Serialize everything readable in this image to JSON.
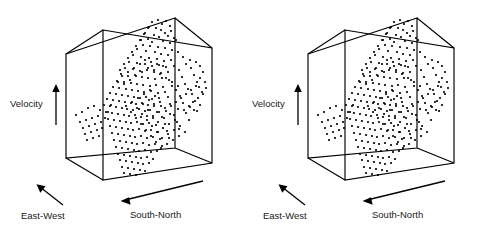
{
  "figure": {
    "type": "stereo-pair-3d-scatter",
    "background": "#ffffff",
    "ink": "#000000",
    "panel_count": 2
  },
  "panels": [
    {
      "id": "left",
      "name": "3d-scatter-left",
      "axes": {
        "velocity": {
          "label": "Velocity",
          "arrow": "up"
        },
        "east_west": {
          "label": "East-West",
          "arrow": "up-left"
        },
        "south_north": {
          "label": "South-North",
          "arrow": "left"
        }
      }
    },
    {
      "id": "right",
      "name": "3d-scatter-right",
      "axes": {
        "velocity": {
          "label": "Velocity",
          "arrow": "up"
        },
        "east_west": {
          "label": "East-West",
          "arrow": "up-left"
        },
        "south_north": {
          "label": "South-North",
          "arrow": "left"
        }
      }
    }
  ],
  "chart_data": {
    "type": "scatter",
    "title": "",
    "xlabel": "South-North",
    "ylabel": "Velocity",
    "zlabel": "East-West",
    "grid": false,
    "legend": null,
    "axis_ticks": [],
    "projection": "oblique-3d-wireframe-box",
    "box": {
      "front_top_left": [
        103,
        30
      ],
      "front_top_right": [
        212,
        48
      ],
      "front_bottom_left": [
        103,
        180
      ],
      "front_bottom_right": [
        212,
        163
      ],
      "back_top_left": [
        66,
        54
      ],
      "back_top_right": [
        175,
        18
      ],
      "back_bottom_left": [
        66,
        158
      ],
      "back_bottom_right": [
        175,
        148
      ]
    },
    "points": [
      [
        152,
        22
      ],
      [
        158,
        20
      ],
      [
        162,
        24
      ],
      [
        166,
        21
      ],
      [
        170,
        26
      ],
      [
        156,
        28
      ],
      [
        161,
        30
      ],
      [
        149,
        27
      ],
      [
        165,
        33
      ],
      [
        171,
        31
      ],
      [
        145,
        33
      ],
      [
        154,
        35
      ],
      [
        159,
        37
      ],
      [
        168,
        36
      ],
      [
        174,
        38
      ],
      [
        148,
        39
      ],
      [
        141,
        40
      ],
      [
        152,
        42
      ],
      [
        163,
        41
      ],
      [
        170,
        43
      ],
      [
        176,
        40
      ],
      [
        143,
        45
      ],
      [
        150,
        46
      ],
      [
        158,
        47
      ],
      [
        165,
        48
      ],
      [
        172,
        50
      ],
      [
        137,
        49
      ],
      [
        146,
        51
      ],
      [
        155,
        52
      ],
      [
        161,
        54
      ],
      [
        168,
        55
      ],
      [
        178,
        52
      ],
      [
        133,
        55
      ],
      [
        141,
        57
      ],
      [
        149,
        58
      ],
      [
        157,
        59
      ],
      [
        164,
        61
      ],
      [
        171,
        60
      ],
      [
        183,
        57
      ],
      [
        190,
        60
      ],
      [
        129,
        62
      ],
      [
        137,
        63
      ],
      [
        145,
        64
      ],
      [
        152,
        66
      ],
      [
        159,
        65
      ],
      [
        166,
        67
      ],
      [
        174,
        66
      ],
      [
        186,
        64
      ],
      [
        196,
        62
      ],
      [
        125,
        68
      ],
      [
        133,
        69
      ],
      [
        140,
        71
      ],
      [
        147,
        70
      ],
      [
        154,
        72
      ],
      [
        161,
        73
      ],
      [
        168,
        72
      ],
      [
        179,
        70
      ],
      [
        191,
        68
      ],
      [
        200,
        66
      ],
      [
        121,
        74
      ],
      [
        128,
        76
      ],
      [
        135,
        75
      ],
      [
        142,
        77
      ],
      [
        148,
        78
      ],
      [
        155,
        79
      ],
      [
        162,
        78
      ],
      [
        169,
        80
      ],
      [
        182,
        77
      ],
      [
        194,
        75
      ],
      [
        203,
        72
      ],
      [
        117,
        81
      ],
      [
        124,
        82
      ],
      [
        131,
        83
      ],
      [
        137,
        84
      ],
      [
        143,
        85
      ],
      [
        150,
        86
      ],
      [
        156,
        85
      ],
      [
        163,
        87
      ],
      [
        172,
        86
      ],
      [
        185,
        84
      ],
      [
        197,
        82
      ],
      [
        113,
        87
      ],
      [
        119,
        88
      ],
      [
        126,
        89
      ],
      [
        132,
        90
      ],
      [
        138,
        91
      ],
      [
        144,
        92
      ],
      [
        151,
        91
      ],
      [
        158,
        93
      ],
      [
        165,
        92
      ],
      [
        176,
        90
      ],
      [
        188,
        89
      ],
      [
        199,
        87
      ],
      [
        110,
        93
      ],
      [
        116,
        94
      ],
      [
        122,
        95
      ],
      [
        128,
        96
      ],
      [
        134,
        97
      ],
      [
        140,
        98
      ],
      [
        146,
        97
      ],
      [
        152,
        99
      ],
      [
        159,
        98
      ],
      [
        168,
        97
      ],
      [
        180,
        96
      ],
      [
        192,
        94
      ],
      [
        202,
        92
      ],
      [
        107,
        99
      ],
      [
        113,
        100
      ],
      [
        119,
        101
      ],
      [
        125,
        102
      ],
      [
        131,
        103
      ],
      [
        136,
        104
      ],
      [
        142,
        103
      ],
      [
        148,
        105
      ],
      [
        154,
        104
      ],
      [
        161,
        106
      ],
      [
        170,
        104
      ],
      [
        183,
        103
      ],
      [
        195,
        101
      ],
      [
        104,
        105
      ],
      [
        110,
        106
      ],
      [
        116,
        107
      ],
      [
        122,
        108
      ],
      [
        127,
        109
      ],
      [
        133,
        110
      ],
      [
        139,
        109
      ],
      [
        145,
        111
      ],
      [
        150,
        110
      ],
      [
        157,
        112
      ],
      [
        166,
        111
      ],
      [
        178,
        109
      ],
      [
        190,
        107
      ],
      [
        200,
        105
      ],
      [
        106,
        112
      ],
      [
        112,
        113
      ],
      [
        118,
        114
      ],
      [
        124,
        115
      ],
      [
        129,
        116
      ],
      [
        135,
        115
      ],
      [
        141,
        117
      ],
      [
        147,
        116
      ],
      [
        153,
        118
      ],
      [
        162,
        117
      ],
      [
        174,
        115
      ],
      [
        186,
        113
      ],
      [
        197,
        111
      ],
      [
        108,
        119
      ],
      [
        114,
        120
      ],
      [
        120,
        121
      ],
      [
        126,
        122
      ],
      [
        131,
        123
      ],
      [
        137,
        122
      ],
      [
        143,
        124
      ],
      [
        149,
        123
      ],
      [
        156,
        125
      ],
      [
        165,
        124
      ],
      [
        177,
        122
      ],
      [
        189,
        120
      ],
      [
        110,
        126
      ],
      [
        116,
        127
      ],
      [
        122,
        128
      ],
      [
        128,
        129
      ],
      [
        133,
        130
      ],
      [
        139,
        129
      ],
      [
        145,
        131
      ],
      [
        151,
        130
      ],
      [
        158,
        132
      ],
      [
        167,
        131
      ],
      [
        179,
        129
      ],
      [
        112,
        133
      ],
      [
        118,
        134
      ],
      [
        124,
        135
      ],
      [
        130,
        136
      ],
      [
        135,
        137
      ],
      [
        141,
        136
      ],
      [
        147,
        138
      ],
      [
        153,
        137
      ],
      [
        160,
        139
      ],
      [
        169,
        138
      ],
      [
        114,
        140
      ],
      [
        120,
        141
      ],
      [
        126,
        142
      ],
      [
        132,
        143
      ],
      [
        137,
        144
      ],
      [
        143,
        143
      ],
      [
        149,
        145
      ],
      [
        155,
        144
      ],
      [
        162,
        146
      ],
      [
        116,
        147
      ],
      [
        122,
        148
      ],
      [
        128,
        149
      ],
      [
        134,
        150
      ],
      [
        139,
        151
      ],
      [
        145,
        150
      ],
      [
        151,
        152
      ],
      [
        157,
        151
      ],
      [
        118,
        154
      ],
      [
        124,
        155
      ],
      [
        130,
        156
      ],
      [
        136,
        157
      ],
      [
        141,
        158
      ],
      [
        147,
        157
      ],
      [
        153,
        159
      ],
      [
        120,
        160
      ],
      [
        126,
        161
      ],
      [
        132,
        162
      ],
      [
        138,
        163
      ],
      [
        143,
        164
      ],
      [
        149,
        163
      ],
      [
        122,
        167
      ],
      [
        128,
        168
      ],
      [
        134,
        169
      ],
      [
        140,
        170
      ],
      [
        145,
        171
      ],
      [
        124,
        173
      ],
      [
        130,
        174
      ],
      [
        136,
        175
      ],
      [
        88,
        108
      ],
      [
        94,
        106
      ],
      [
        100,
        110
      ],
      [
        82,
        112
      ],
      [
        76,
        115
      ],
      [
        92,
        118
      ],
      [
        98,
        116
      ],
      [
        86,
        120
      ],
      [
        80,
        122
      ],
      [
        95,
        124
      ],
      [
        101,
        122
      ],
      [
        89,
        126
      ],
      [
        83,
        128
      ],
      [
        97,
        130
      ],
      [
        91,
        132
      ],
      [
        85,
        134
      ],
      [
        99,
        136
      ],
      [
        93,
        138
      ],
      [
        87,
        140
      ],
      [
        102,
        128
      ],
      [
        105,
        118
      ],
      [
        108,
        112
      ],
      [
        111,
        105
      ],
      [
        200,
        78
      ],
      [
        205,
        82
      ],
      [
        196,
        86
      ],
      [
        191,
        90
      ],
      [
        203,
        94
      ],
      [
        198,
        98
      ],
      [
        193,
        102
      ],
      [
        206,
        88
      ],
      [
        186,
        94
      ],
      [
        181,
        98
      ],
      [
        176,
        102
      ],
      [
        171,
        106
      ],
      [
        184,
        110
      ],
      [
        189,
        106
      ],
      [
        194,
        110
      ],
      [
        145,
        60
      ],
      [
        151,
        62
      ],
      [
        157,
        64
      ],
      [
        163,
        66
      ],
      [
        140,
        64
      ],
      [
        134,
        68
      ],
      [
        128,
        72
      ],
      [
        122,
        76
      ],
      [
        118,
        82
      ],
      [
        124,
        84
      ],
      [
        130,
        80
      ],
      [
        136,
        76
      ],
      [
        142,
        72
      ],
      [
        148,
        68
      ],
      [
        154,
        70
      ],
      [
        160,
        74
      ],
      [
        166,
        78
      ],
      [
        172,
        82
      ],
      [
        178,
        86
      ],
      [
        150,
        90
      ],
      [
        144,
        94
      ],
      [
        138,
        98
      ],
      [
        132,
        102
      ],
      [
        126,
        106
      ],
      [
        155,
        96
      ],
      [
        149,
        100
      ],
      [
        143,
        104
      ],
      [
        137,
        108
      ],
      [
        131,
        112
      ],
      [
        160,
        102
      ],
      [
        154,
        106
      ],
      [
        148,
        110
      ],
      [
        142,
        114
      ],
      [
        136,
        118
      ],
      [
        165,
        108
      ],
      [
        159,
        112
      ],
      [
        153,
        116
      ],
      [
        147,
        120
      ],
      [
        141,
        124
      ],
      [
        170,
        114
      ],
      [
        164,
        118
      ],
      [
        158,
        122
      ],
      [
        152,
        126
      ],
      [
        146,
        130
      ],
      [
        175,
        120
      ],
      [
        169,
        124
      ],
      [
        163,
        128
      ],
      [
        157,
        132
      ],
      [
        151,
        136
      ],
      [
        180,
        126
      ],
      [
        174,
        130
      ],
      [
        168,
        134
      ],
      [
        162,
        138
      ],
      [
        156,
        142
      ],
      [
        185,
        132
      ],
      [
        179,
        136
      ],
      [
        173,
        140
      ],
      [
        167,
        144
      ],
      [
        161,
        148
      ],
      [
        128,
        58
      ],
      [
        132,
        52
      ],
      [
        136,
        46
      ],
      [
        140,
        40
      ],
      [
        144,
        34
      ],
      [
        148,
        28
      ],
      [
        124,
        64
      ],
      [
        120,
        70
      ]
    ],
    "point_count": 310,
    "point_radius": 1.1,
    "clusters": [
      {
        "name": "dense-core",
        "center": [
          136,
          108
        ],
        "extent": [
          40,
          45
        ],
        "density": "high"
      },
      {
        "name": "upper-filament",
        "center": [
          160,
          40
        ],
        "extent": [
          45,
          40
        ],
        "density": "medium"
      },
      {
        "name": "lower-filament",
        "center": [
          130,
          160
        ],
        "extent": [
          45,
          35
        ],
        "density": "medium"
      },
      {
        "name": "left-streak",
        "center": [
          90,
          122
        ],
        "extent": [
          38,
          28
        ],
        "density": "low"
      },
      {
        "name": "right-streak",
        "center": [
          194,
          92
        ],
        "extent": [
          30,
          30
        ],
        "density": "low"
      }
    ]
  }
}
